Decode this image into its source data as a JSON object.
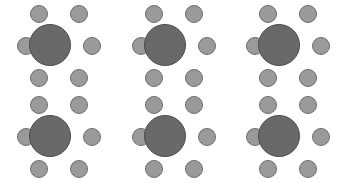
{
  "canvas": {
    "width": 345,
    "height": 183,
    "background_color": "#ffffff"
  },
  "diagram": {
    "title": "",
    "grid": {
      "columns": 3,
      "rows": 2,
      "total_clusters": 6
    },
    "table_style": {
      "shape": "circle",
      "diameter": 42,
      "fill_color": "#696969",
      "stroke_color": "#4d4d4d",
      "stroke_width": 1
    },
    "seat_style": {
      "shape": "circle",
      "diameter": 18,
      "fill_color": "#9a9a9a",
      "stroke_color": "#6e6e6e",
      "stroke_width": 1,
      "count_per_table": 6
    },
    "seat_offsets": [
      {
        "name": "seat-top-left",
        "x": 16,
        "y": 2
      },
      {
        "name": "seat-top-right",
        "x": 56,
        "y": 2
      },
      {
        "name": "seat-middle-left",
        "x": 3,
        "y": 34
      },
      {
        "name": "seat-middle-right",
        "x": 69,
        "y": 34
      },
      {
        "name": "seat-bottom-left",
        "x": 16,
        "y": 66
      },
      {
        "name": "seat-bottom-right",
        "x": 56,
        "y": 66
      }
    ],
    "table_offset": {
      "x": 15,
      "y": 21
    },
    "clusters": [
      {
        "id": "table-1",
        "label": "Table 1",
        "x": 14,
        "y": 3,
        "row": 1,
        "column": 1,
        "seats": 6
      },
      {
        "id": "table-2",
        "label": "Table 2",
        "x": 129,
        "y": 3,
        "row": 1,
        "column": 2,
        "seats": 6
      },
      {
        "id": "table-3",
        "label": "Table 3",
        "x": 243,
        "y": 3,
        "row": 1,
        "column": 3,
        "seats": 6
      },
      {
        "id": "table-4",
        "label": "Table 4",
        "x": 14,
        "y": 94,
        "row": 2,
        "column": 1,
        "seats": 6
      },
      {
        "id": "table-5",
        "label": "Table 5",
        "x": 129,
        "y": 94,
        "row": 2,
        "column": 2,
        "seats": 6
      },
      {
        "id": "table-6",
        "label": "Table 6",
        "x": 243,
        "y": 94,
        "row": 2,
        "column": 3,
        "seats": 6
      }
    ]
  }
}
